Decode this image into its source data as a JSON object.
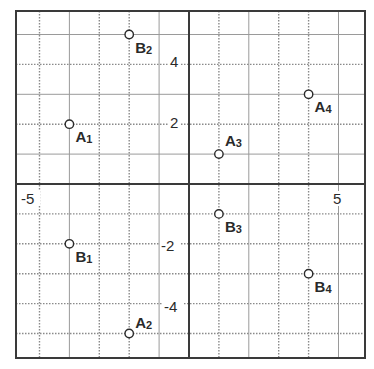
{
  "chart_data": {
    "type": "scatter",
    "title": "",
    "xlabel": "",
    "ylabel": "",
    "xlim": [
      -5.8,
      5.9
    ],
    "ylim": [
      -5.85,
      5.8
    ],
    "grid": true,
    "tick_labels": [
      {
        "text": "4",
        "axis": "y",
        "value": 4
      },
      {
        "text": "2",
        "axis": "y",
        "value": 2
      },
      {
        "text": "-2",
        "axis": "y",
        "value": -2
      },
      {
        "text": "-4",
        "axis": "y",
        "value": -4
      },
      {
        "text": "-5",
        "axis": "x",
        "value": -5
      },
      {
        "text": "5",
        "axis": "x",
        "value": 5
      }
    ],
    "points": [
      {
        "letter": "A",
        "sub": "1",
        "x": -4,
        "y": 2,
        "label_dx": 6,
        "label_dy": 18
      },
      {
        "letter": "A",
        "sub": "2",
        "x": -2,
        "y": -5,
        "label_dx": 6,
        "label_dy": -6
      },
      {
        "letter": "A",
        "sub": "3",
        "x": 1,
        "y": 1,
        "label_dx": 6,
        "label_dy": -8
      },
      {
        "letter": "A",
        "sub": "4",
        "x": 4,
        "y": 3,
        "label_dx": 6,
        "label_dy": 18
      },
      {
        "letter": "B",
        "sub": "1",
        "x": -4,
        "y": -2,
        "label_dx": 6,
        "label_dy": 18
      },
      {
        "letter": "B",
        "sub": "2",
        "x": -2,
        "y": 5,
        "label_dx": 6,
        "label_dy": 18
      },
      {
        "letter": "B",
        "sub": "3",
        "x": 1,
        "y": -1,
        "label_dx": 6,
        "label_dy": 18
      },
      {
        "letter": "B",
        "sub": "4",
        "x": 4,
        "y": -3,
        "label_dx": 6,
        "label_dy": 18
      }
    ],
    "vertical_lines": [
      {
        "x": -5,
        "style": "dotted"
      },
      {
        "x": -4,
        "style": "solid"
      },
      {
        "x": -3,
        "style": "dotted"
      },
      {
        "x": -2,
        "style": "dotted"
      },
      {
        "x": -1,
        "style": "solid"
      },
      {
        "x": 1,
        "style": "dotted"
      },
      {
        "x": 2,
        "style": "solid"
      },
      {
        "x": 3,
        "style": "dotted"
      },
      {
        "x": 4,
        "style": "dotted"
      },
      {
        "x": 5,
        "style": "solid"
      }
    ],
    "horizontal_lines": [
      {
        "y": 5,
        "style": "solid"
      },
      {
        "y": 4,
        "style": "dotted"
      },
      {
        "y": 3,
        "style": "solid"
      },
      {
        "y": 2,
        "style": "dotted"
      },
      {
        "y": 1,
        "style": "solid"
      },
      {
        "y": -1,
        "style": "dotted"
      },
      {
        "y": -2,
        "style": "dotted"
      },
      {
        "y": -3,
        "style": "dotted"
      },
      {
        "y": -4,
        "style": "dotted"
      },
      {
        "y": -5,
        "style": "dotted"
      }
    ]
  },
  "layout": {
    "origin_px": [
      189,
      184
    ],
    "unit_px": 29.9,
    "frame_px": {
      "left": 16,
      "top": 11,
      "right": 365,
      "bottom": 358
    },
    "colors": {
      "frame": "#3a3a3a",
      "axis": "#3a3a3a",
      "grid_solid": "#9a9a9a",
      "grid_dotted": "#8a8a8a",
      "point_stroke": "#2a2a2a",
      "point_fill": "#ffffff",
      "text": "#2a2a2a"
    }
  },
  "tick_positions_px": [
    {
      "text": "4",
      "x": 170,
      "y": 67
    },
    {
      "text": "2",
      "x": 170,
      "y": 128
    },
    {
      "text": "-2",
      "x": 161,
      "y": 251
    },
    {
      "text": "-4",
      "x": 164,
      "y": 312
    },
    {
      "text": "-5",
      "x": 21,
      "y": 204
    },
    {
      "text": "5",
      "x": 333,
      "y": 204
    }
  ]
}
